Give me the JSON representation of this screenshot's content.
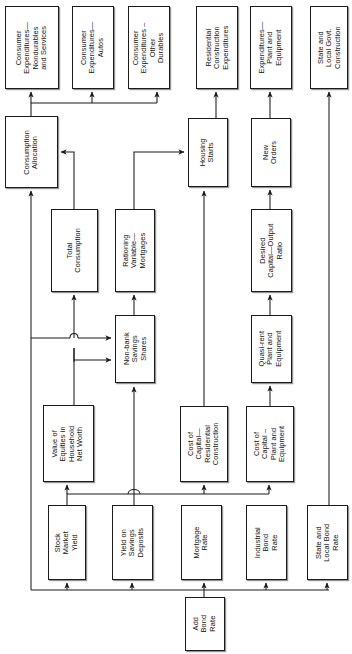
{
  "diagram": {
    "orientation": "rotated-90-labels",
    "stroke_color": "#1a1a1a",
    "background_color": "#ffffff"
  },
  "nodes": [
    {
      "id": "cons_nondur",
      "label": "Consumer\nExpenditures—\nNondurables\nand Services",
      "x": 5,
      "y": 6,
      "w": 54,
      "h": 83
    },
    {
      "id": "cons_autos",
      "label": "Consumer\nExpenditures—\nAutos",
      "x": 72,
      "y": 6,
      "w": 42,
      "h": 83
    },
    {
      "id": "cons_other",
      "label": "Consumer\nExpenditures –\nOther\nDurables",
      "x": 128,
      "y": 6,
      "w": 42,
      "h": 83
    },
    {
      "id": "res_constr",
      "label": "Residential\nConstruction\nExpenditures",
      "x": 196,
      "y": 6,
      "w": 42,
      "h": 83
    },
    {
      "id": "exp_plant",
      "label": "Expenditures—\nPlant and\nEquipment",
      "x": 250,
      "y": 6,
      "w": 42,
      "h": 83
    },
    {
      "id": "state_constr",
      "label": "State and\nLocal Govt.\nConstruction",
      "x": 310,
      "y": 6,
      "w": 38,
      "h": 83
    },
    {
      "id": "cons_alloc",
      "label": "Consumption\nAllocation",
      "x": 5,
      "y": 116,
      "w": 53,
      "h": 72
    },
    {
      "id": "housing",
      "label": "Housing\nStarts",
      "x": 188,
      "y": 118,
      "w": 40,
      "h": 69
    },
    {
      "id": "new_orders",
      "label": "New\nOrders",
      "x": 251,
      "y": 118,
      "w": 40,
      "h": 69
    },
    {
      "id": "total_cons",
      "label": "Total\nConsumption",
      "x": 51,
      "y": 209,
      "w": 47,
      "h": 83
    },
    {
      "id": "rationing",
      "label": "Rationing\nVariable—\nMortgages",
      "x": 115,
      "y": 209,
      "w": 40,
      "h": 83
    },
    {
      "id": "desired_cor",
      "label": "Desired\nCapital—Output\nRatio",
      "x": 251,
      "y": 209,
      "w": 41,
      "h": 83
    },
    {
      "id": "nonbank",
      "label": "Non-bank\nSavings\nShares",
      "x": 115,
      "y": 315,
      "w": 40,
      "h": 68
    },
    {
      "id": "quasi_rent",
      "label": "Quasi-rent\nPlant and\nEquipment",
      "x": 251,
      "y": 315,
      "w": 41,
      "h": 68
    },
    {
      "id": "value_eq",
      "label": "Value of\nEquities in\nHousehold\nNet Worth",
      "x": 43,
      "y": 405,
      "w": 51,
      "h": 77
    },
    {
      "id": "coc_res",
      "label": "Cost of\nCapital—\nResidential\nConstruction",
      "x": 180,
      "y": 406,
      "w": 48,
      "h": 76
    },
    {
      "id": "coc_plant",
      "label": "Cost of\nCapital –\nPlant and\nEquipment",
      "x": 246,
      "y": 406,
      "w": 48,
      "h": 76
    },
    {
      "id": "stock_yield",
      "label": "Stock\nMarket\nYield",
      "x": 48,
      "y": 505,
      "w": 38,
      "h": 75
    },
    {
      "id": "yield_sav",
      "label": "Yield on\nSavings\nDeposits",
      "x": 112,
      "y": 505,
      "w": 41,
      "h": 75
    },
    {
      "id": "mortgage",
      "label": "Mortgage\nRate",
      "x": 181,
      "y": 505,
      "w": 41,
      "h": 75
    },
    {
      "id": "ind_bond",
      "label": "Industrial\nBond\nRate",
      "x": 246,
      "y": 505,
      "w": 41,
      "h": 75
    },
    {
      "id": "state_bond",
      "label": "State and\nLocal Bond\nRate",
      "x": 307,
      "y": 505,
      "w": 41,
      "h": 75
    },
    {
      "id": "add_bond",
      "label": "Add\nBond\nRate",
      "x": 185,
      "y": 597,
      "w": 40,
      "h": 54
    }
  ],
  "edges": [
    {
      "from": "cons_alloc",
      "to": "cons_nondur",
      "kind": "bus-up"
    },
    {
      "from": "cons_alloc",
      "to": "cons_autos",
      "kind": "bus-up"
    },
    {
      "from": "cons_alloc",
      "to": "cons_other",
      "kind": "bus-up"
    },
    {
      "from": "housing",
      "to": "res_constr",
      "kind": "straight-up"
    },
    {
      "from": "new_orders",
      "to": "exp_plant",
      "kind": "straight-up"
    },
    {
      "from": "state_bond",
      "to": "state_constr",
      "kind": "long-vertical"
    },
    {
      "from": "total_cons",
      "to": "cons_alloc",
      "kind": "elbow"
    },
    {
      "from": "rationing",
      "to": "housing",
      "kind": "elbow"
    },
    {
      "from": "nonbank",
      "to": "rationing",
      "kind": "straight-up"
    },
    {
      "from": "nonbank",
      "to": "total_cons",
      "kind": "elbow-hop"
    },
    {
      "from": "value_eq",
      "to": "nonbank",
      "kind": "elbow"
    },
    {
      "from": "value_eq",
      "to": "total_cons",
      "kind": "bus-left"
    },
    {
      "from": "yield_sav",
      "to": "nonbank",
      "kind": "elbow"
    },
    {
      "from": "stock_yield",
      "to": "value_eq",
      "kind": "straight-up"
    },
    {
      "from": "mortgage",
      "to": "coc_res",
      "kind": "straight-up"
    },
    {
      "from": "ind_bond",
      "to": "coc_plant",
      "kind": "straight-up"
    },
    {
      "from": "coc_res",
      "to": "housing",
      "kind": "long-vertical"
    },
    {
      "from": "coc_plant",
      "to": "quasi_rent",
      "kind": "straight-up"
    },
    {
      "from": "quasi_rent",
      "to": "desired_cor",
      "kind": "straight-up"
    },
    {
      "from": "desired_cor",
      "to": "new_orders",
      "kind": "straight-up"
    },
    {
      "from": "add_bond",
      "to": "stock_yield",
      "kind": "bus-down"
    },
    {
      "from": "add_bond",
      "to": "yield_sav",
      "kind": "bus-down"
    },
    {
      "from": "add_bond",
      "to": "mortgage",
      "kind": "bus-down"
    },
    {
      "from": "add_bond",
      "to": "ind_bond",
      "kind": "bus-down"
    },
    {
      "from": "add_bond",
      "to": "state_bond",
      "kind": "bus-down"
    }
  ]
}
